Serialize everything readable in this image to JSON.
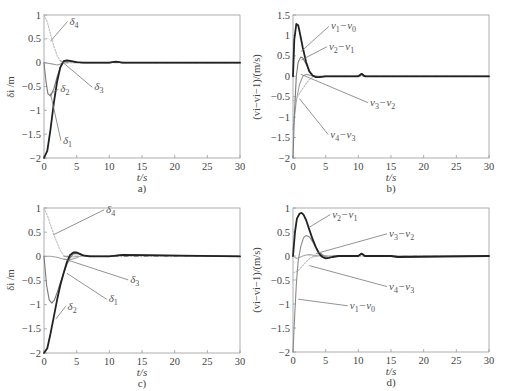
{
  "figure": {
    "panels": [
      {
        "id": "a",
        "panel_label": "a)",
        "xlabel": "t/s",
        "ylabel": "δi /m"
      },
      {
        "id": "b",
        "panel_label": "b)",
        "xlabel": "t/s",
        "ylabel": "(vi−vi−1)/(m/s)"
      },
      {
        "id": "c",
        "panel_label": "c)",
        "xlabel": "t/s",
        "ylabel": "δi /m"
      },
      {
        "id": "d",
        "panel_label": "d)",
        "xlabel": "t/s",
        "ylabel": "(vi−vi−1)/(m/s)"
      }
    ]
  },
  "chart_data": [
    {
      "panel": "a)",
      "type": "line",
      "title": "",
      "xlabel": "t/s",
      "ylabel": "δ_i /m",
      "xlim": [
        0,
        30
      ],
      "ylim": [
        -2,
        1
      ],
      "xticks": [
        0,
        5,
        10,
        15,
        20,
        25,
        30
      ],
      "yticks": [
        -2,
        -1.5,
        -1,
        -0.5,
        0,
        0.5,
        1
      ],
      "grid": false,
      "legend": "inline annotations",
      "series": [
        {
          "name": "δ1",
          "style": "solid dark thick",
          "color": "#222222",
          "x": [
            0,
            0.5,
            1,
            1.5,
            2,
            2.5,
            3,
            3.5,
            4,
            5,
            6,
            8,
            10,
            11,
            12,
            15,
            30
          ],
          "y": [
            -2,
            -1.85,
            -1.4,
            -0.85,
            -0.4,
            -0.1,
            0.03,
            0.05,
            0.04,
            0.01,
            0,
            0,
            0,
            0.02,
            0,
            0,
            0
          ]
        },
        {
          "name": "δ2",
          "style": "solid gray",
          "color": "#7a7a7a",
          "x": [
            0,
            0.3,
            0.6,
            1,
            1.5,
            2,
            2.5,
            3,
            3.5,
            4,
            5,
            6,
            10,
            11,
            12,
            30
          ],
          "y": [
            0,
            -0.4,
            -0.65,
            -0.7,
            -0.55,
            -0.3,
            -0.1,
            0.02,
            0.04,
            0.03,
            0.01,
            0,
            0,
            0.02,
            0,
            0
          ]
        },
        {
          "name": "δ3",
          "style": "solid light",
          "color": "#9e9e9e",
          "x": [
            0,
            1,
            2,
            2.5,
            3,
            3.5,
            4,
            5,
            6,
            10,
            11,
            12,
            30
          ],
          "y": [
            0,
            -0.02,
            -0.05,
            -0.03,
            0,
            0.02,
            0.02,
            0.01,
            0,
            0,
            0.02,
            0,
            0
          ]
        },
        {
          "name": "δ4",
          "style": "dotted light",
          "color": "#bdbdbd",
          "x": [
            0,
            0.5,
            1,
            1.5,
            2,
            2.5,
            3,
            3.5,
            4,
            5,
            6,
            10,
            11,
            12,
            30
          ],
          "y": [
            1,
            0.85,
            0.6,
            0.35,
            0.15,
            0.03,
            0,
            -0.01,
            0,
            0,
            0,
            0,
            0.02,
            0,
            0
          ]
        }
      ],
      "annotations": [
        {
          "text": "δ4",
          "x": 3.9,
          "y": 0.8
        },
        {
          "text": "δ3",
          "x": 7.7,
          "y": -0.58
        },
        {
          "text": "δ2",
          "x": 2.5,
          "y": -0.62
        },
        {
          "text": "δ1",
          "x": 2.9,
          "y": -1.7
        }
      ]
    },
    {
      "panel": "b)",
      "type": "line",
      "title": "",
      "xlabel": "t/s",
      "ylabel": "(v_i − v_{i−1})/(m/s)",
      "xlim": [
        0,
        30
      ],
      "ylim": [
        -2,
        1.5
      ],
      "xticks": [
        0,
        5,
        10,
        15,
        20,
        25,
        30
      ],
      "yticks": [
        -2,
        -1.5,
        -1,
        -0.5,
        0,
        0.5,
        1,
        1.5
      ],
      "grid": false,
      "legend": "inline annotations",
      "series": [
        {
          "name": "v1−v0",
          "style": "solid dark thick",
          "color": "#222222",
          "x": [
            0,
            0.2,
            0.5,
            0.8,
            1,
            1.5,
            2,
            2.5,
            3,
            3.5,
            4,
            5,
            6,
            10,
            10.5,
            11,
            15,
            30
          ],
          "y": [
            0,
            0.9,
            1.28,
            1.25,
            1.1,
            0.7,
            0.35,
            0.12,
            0.02,
            -0.02,
            -0.02,
            0,
            0,
            0,
            0.06,
            0,
            0,
            0
          ]
        },
        {
          "name": "v2−v1",
          "style": "solid gray",
          "color": "#7a7a7a",
          "x": [
            0,
            0.2,
            0.5,
            0.8,
            1.2,
            1.5,
            2,
            2.5,
            3,
            3.5,
            4,
            5,
            6,
            10,
            10.5,
            11,
            15,
            30
          ],
          "y": [
            -2,
            -1,
            0,
            0.35,
            0.47,
            0.45,
            0.3,
            0.13,
            0.03,
            -0.02,
            -0.02,
            0,
            0,
            0,
            0.05,
            0,
            0,
            0
          ]
        },
        {
          "name": "v3−v2",
          "style": "solid light",
          "color": "#a0a0a0",
          "x": [
            0,
            0.5,
            1,
            1.5,
            2,
            2.5,
            3,
            3.5,
            4,
            5,
            10,
            10.5,
            11,
            15,
            30
          ],
          "y": [
            -1.3,
            -0.6,
            -0.2,
            0,
            0.05,
            0.03,
            0.01,
            0,
            0,
            0,
            0,
            0.04,
            0,
            0,
            0
          ]
        },
        {
          "name": "v4−v3",
          "style": "dotted light",
          "color": "#bdbdbd",
          "x": [
            0,
            0.5,
            1,
            1.5,
            2,
            2.5,
            3,
            4,
            5,
            10,
            10.5,
            11,
            15,
            30
          ],
          "y": [
            -0.6,
            -0.55,
            -0.42,
            -0.3,
            -0.18,
            -0.08,
            -0.02,
            0,
            0,
            0,
            0.03,
            0,
            0,
            0
          ]
        }
      ],
      "annotations": [
        {
          "text": "v1−v0",
          "x": 5.8,
          "y": 1.15
        },
        {
          "text": "v2−v1",
          "x": 5.5,
          "y": 0.65
        },
        {
          "text": "v3−v2",
          "x": 11.8,
          "y": -0.72
        },
        {
          "text": "v4−v3",
          "x": 5.7,
          "y": -1.5
        }
      ]
    },
    {
      "panel": "c)",
      "type": "line",
      "title": "",
      "xlabel": "t/s",
      "ylabel": "δ_i /m",
      "xlim": [
        0,
        30
      ],
      "ylim": [
        -2,
        1
      ],
      "xticks": [
        0,
        5,
        10,
        15,
        20,
        25,
        30
      ],
      "yticks": [
        -2,
        -1.5,
        -1,
        -0.5,
        0,
        0.5,
        1
      ],
      "grid": false,
      "legend": "inline annotations",
      "series": [
        {
          "name": "δ1",
          "style": "solid dark thick",
          "color": "#222222",
          "x": [
            0,
            0.5,
            1,
            1.5,
            2,
            2.5,
            3,
            3.5,
            4,
            4.5,
            5,
            5.5,
            6,
            7,
            8,
            10,
            12,
            30
          ],
          "y": [
            -2,
            -1.9,
            -1.6,
            -1.25,
            -0.9,
            -0.6,
            -0.35,
            -0.12,
            0.03,
            0.08,
            0.08,
            0.05,
            0.02,
            0,
            0,
            0,
            0.03,
            0
          ]
        },
        {
          "name": "δ2",
          "style": "solid gray",
          "color": "#7a7a7a",
          "x": [
            0,
            0.4,
            0.8,
            1.2,
            1.6,
            2,
            2.5,
            3,
            3.5,
            4,
            4.5,
            5,
            5.5,
            6,
            7,
            8,
            10,
            12,
            30
          ],
          "y": [
            0,
            -0.6,
            -0.9,
            -0.97,
            -0.9,
            -0.75,
            -0.55,
            -0.35,
            -0.17,
            -0.03,
            0.05,
            0.06,
            0.04,
            0.02,
            0,
            0,
            0,
            0.03,
            0
          ]
        },
        {
          "name": "δ3",
          "style": "solid light",
          "color": "#a0a0a0",
          "x": [
            0,
            1,
            2,
            3,
            4,
            5,
            5.5,
            6,
            7,
            8,
            10,
            12,
            30
          ],
          "y": [
            0,
            0,
            -0.02,
            -0.06,
            -0.07,
            -0.03,
            0,
            0.02,
            0.01,
            0,
            0,
            0.02,
            0
          ]
        },
        {
          "name": "δ4",
          "style": "dotted light",
          "color": "#bdbdbd",
          "x": [
            0,
            0.5,
            1,
            1.5,
            2,
            2.5,
            3,
            3.5,
            4,
            5,
            6,
            8,
            10,
            12,
            30
          ],
          "y": [
            1,
            0.85,
            0.65,
            0.45,
            0.28,
            0.12,
            0.02,
            -0.02,
            -0.02,
            0,
            0,
            0,
            0,
            0.02,
            0
          ]
        }
      ],
      "annotations": [
        {
          "text": "δ4",
          "x": 9.5,
          "y": 0.9
        },
        {
          "text": "δ3",
          "x": 13.2,
          "y": -0.55
        },
        {
          "text": "δ1",
          "x": 9.9,
          "y": -0.95
        },
        {
          "text": "δ2",
          "x": 3.6,
          "y": -1.1
        }
      ]
    },
    {
      "panel": "d)",
      "type": "line",
      "title": "",
      "xlabel": "t/s",
      "ylabel": "(v_i − v_{i−1})/(m/s)",
      "xlim": [
        0,
        30
      ],
      "ylim": [
        -2,
        1
      ],
      "xticks": [
        0,
        5,
        10,
        15,
        20,
        25,
        30
      ],
      "yticks": [
        -2,
        -1.5,
        -1,
        -0.5,
        0,
        0.5,
        1
      ],
      "grid": false,
      "legend": "inline annotations",
      "series": [
        {
          "name": "v1−v0",
          "style": "solid gray",
          "color": "#8a8a8a",
          "x": [
            0,
            0.2,
            0.5,
            0.8,
            1.2,
            1.6,
            2,
            2.5,
            3,
            3.5,
            4,
            5,
            5.5,
            6,
            7,
            8,
            10,
            10.5,
            11,
            15,
            16,
            30
          ],
          "y": [
            -2,
            -1.4,
            -0.6,
            -0.1,
            0.2,
            0.38,
            0.43,
            0.4,
            0.3,
            0.18,
            0.08,
            -0.02,
            -0.03,
            -0.02,
            0,
            0,
            0,
            0.05,
            0,
            0,
            -0.02,
            0
          ]
        },
        {
          "name": "v2−v1",
          "style": "solid dark thick",
          "color": "#222222",
          "x": [
            0,
            0.3,
            0.6,
            1,
            1.3,
            1.6,
            2,
            2.5,
            3,
            3.5,
            4,
            4.5,
            5,
            5.5,
            6,
            7,
            8,
            10,
            10.5,
            11,
            15,
            16,
            30
          ],
          "y": [
            0,
            0.5,
            0.78,
            0.88,
            0.9,
            0.86,
            0.75,
            0.55,
            0.35,
            0.18,
            0.05,
            -0.02,
            -0.05,
            -0.04,
            -0.02,
            0,
            0,
            0,
            0.05,
            0,
            0,
            -0.02,
            0
          ]
        },
        {
          "name": "v3−v2",
          "style": "solid light",
          "color": "#a8a8a8",
          "x": [
            0,
            0.5,
            1,
            1.5,
            2,
            2.5,
            3,
            4,
            5,
            6,
            10,
            10.5,
            11,
            30
          ],
          "y": [
            0,
            -0.05,
            -0.03,
            0,
            0.02,
            0.03,
            0.02,
            0.01,
            0,
            0,
            0,
            0.04,
            0,
            0
          ]
        },
        {
          "name": "v4−v3",
          "style": "dotted light",
          "color": "#c0c0c0",
          "x": [
            0,
            0.5,
            1,
            1.5,
            2,
            2.5,
            3,
            4,
            5,
            6,
            10,
            30
          ],
          "y": [
            -0.35,
            -0.33,
            -0.28,
            -0.2,
            -0.12,
            -0.06,
            -0.02,
            0,
            0,
            0,
            0,
            0
          ]
        }
      ],
      "annotations": [
        {
          "text": "v2−v1",
          "x": 6,
          "y": 0.8
        },
        {
          "text": "v3−v2",
          "x": 14.7,
          "y": 0.4
        },
        {
          "text": "v4−v3",
          "x": 14.7,
          "y": -0.7
        },
        {
          "text": "v1−v0",
          "x": 8.7,
          "y": -1.1
        }
      ]
    }
  ]
}
